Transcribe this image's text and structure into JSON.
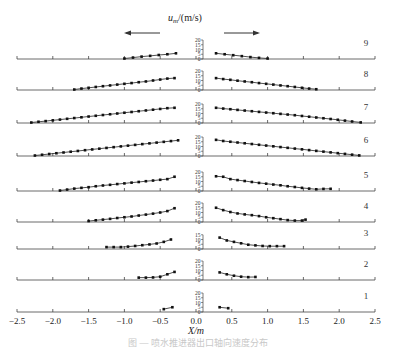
{
  "chart_data": {
    "type": "line",
    "title": "",
    "ylabel": "u_m/(m/s)",
    "ylabel_main": "u",
    "ylabel_sub": "m",
    "ylabel_unit": "/(m/s)",
    "xlabel": "X/m",
    "xlim": [
      -2.5,
      2.5
    ],
    "x_ticks": [
      -2.5,
      -2.0,
      -1.5,
      -1.0,
      -0.5,
      0.0,
      0.5,
      1.0,
      1.5,
      2.0,
      2.5
    ],
    "x_tick_labels": [
      "-2.5",
      "-2.0",
      "-1.5",
      "-1.0",
      "-0.5",
      "0.0",
      "0.5",
      "1.0",
      "1.5",
      "2.0",
      "2.5"
    ],
    "grid": false,
    "direction_arrows": [
      "left",
      "right"
    ],
    "panels": [
      {
        "label": "9",
        "y_ticks": [
          0,
          5,
          10,
          15,
          20
        ],
        "ylim": [
          0,
          20
        ],
        "left": {
          "x": [
            -1.0,
            -0.88,
            -0.76,
            -0.64,
            -0.52,
            -0.4,
            -0.28
          ],
          "y": [
            0.5,
            1.5,
            2.5,
            3.3,
            4.2,
            5.0,
            6.0
          ]
        },
        "right": {
          "x": [
            0.28,
            0.4,
            0.52,
            0.64,
            0.76,
            0.88,
            1.0
          ],
          "y": [
            6.0,
            5.0,
            4.0,
            3.0,
            2.0,
            1.2,
            0.5
          ]
        }
      },
      {
        "label": "8",
        "y_ticks": [
          0,
          5,
          10,
          15,
          20
        ],
        "ylim": [
          0,
          20
        ],
        "left": {
          "x": [
            -1.7,
            -1.6,
            -1.5,
            -1.4,
            -1.3,
            -1.2,
            -1.1,
            -1.0,
            -0.9,
            -0.8,
            -0.7,
            -0.6,
            -0.5,
            -0.4,
            -0.3
          ],
          "y": [
            0.5,
            1.5,
            2.3,
            3.2,
            4.0,
            4.8,
            5.7,
            6.5,
            7.3,
            8.2,
            9.0,
            10.0,
            11.0,
            12.0,
            12.5
          ]
        },
        "right": {
          "x": [
            0.28,
            0.38,
            0.48,
            0.58,
            0.68,
            0.78,
            0.88,
            0.98,
            1.08,
            1.18,
            1.28,
            1.38,
            1.48,
            1.58,
            1.68
          ],
          "y": [
            12.5,
            11.5,
            10.7,
            9.8,
            9.0,
            8.2,
            7.3,
            6.5,
            5.7,
            4.8,
            4.0,
            3.2,
            2.3,
            1.5,
            0.8
          ]
        }
      },
      {
        "label": "7",
        "y_ticks": [
          0,
          5,
          10,
          15,
          20
        ],
        "ylim": [
          0,
          20
        ],
        "left": {
          "x": [
            -2.3,
            -2.2,
            -2.1,
            -2.0,
            -1.9,
            -1.8,
            -1.7,
            -1.6,
            -1.5,
            -1.4,
            -1.3,
            -1.2,
            -1.1,
            -1.0,
            -0.9,
            -0.8,
            -0.7,
            -0.6,
            -0.5,
            -0.4,
            -0.3
          ],
          "y": [
            0.5,
            1.3,
            2.0,
            2.8,
            3.6,
            4.4,
            5.2,
            6.0,
            6.8,
            7.6,
            8.4,
            9.2,
            10.0,
            10.8,
            11.6,
            12.4,
            13.2,
            14.0,
            14.8,
            15.6,
            16.0
          ]
        },
        "right": {
          "x": [
            0.28,
            0.38,
            0.48,
            0.58,
            0.68,
            0.78,
            0.88,
            0.98,
            1.08,
            1.18,
            1.28,
            1.38,
            1.48,
            1.58,
            1.68,
            1.78,
            1.88,
            1.98,
            2.08,
            2.18,
            2.3
          ],
          "y": [
            16.0,
            15.2,
            14.5,
            13.8,
            13.1,
            12.4,
            11.7,
            11.0,
            10.3,
            9.6,
            8.9,
            8.2,
            7.4,
            6.6,
            5.8,
            5.0,
            4.2,
            3.4,
            2.5,
            1.6,
            0.6
          ]
        }
      },
      {
        "label": "6",
        "y_ticks": [
          0,
          5,
          10,
          15,
          20
        ],
        "ylim": [
          0,
          20
        ],
        "left": {
          "x": [
            -2.25,
            -2.15,
            -2.05,
            -1.95,
            -1.85,
            -1.75,
            -1.65,
            -1.55,
            -1.45,
            -1.35,
            -1.25,
            -1.15,
            -1.05,
            -0.95,
            -0.85,
            -0.75,
            -0.65,
            -0.55,
            -0.45,
            -0.35,
            -0.25
          ],
          "y": [
            0.5,
            1.3,
            2.1,
            2.9,
            3.7,
            4.5,
            5.3,
            6.1,
            6.9,
            7.7,
            8.5,
            9.3,
            10.1,
            10.9,
            11.7,
            12.5,
            13.3,
            14.1,
            14.9,
            15.7,
            16.5
          ]
        },
        "right": {
          "x": [
            0.28,
            0.38,
            0.48,
            0.58,
            0.68,
            0.78,
            0.88,
            0.98,
            1.08,
            1.18,
            1.28,
            1.38,
            1.48,
            1.58,
            1.68,
            1.78,
            1.88,
            1.98,
            2.08,
            2.18,
            2.28
          ],
          "y": [
            17.0,
            15.8,
            15.0,
            14.2,
            13.4,
            12.6,
            11.8,
            11.0,
            10.2,
            9.4,
            8.6,
            7.8,
            7.0,
            6.2,
            5.4,
            4.6,
            3.8,
            3.0,
            2.2,
            1.4,
            0.6
          ]
        }
      },
      {
        "label": "5",
        "y_ticks": [
          0,
          5,
          10,
          15,
          20
        ],
        "ylim": [
          0,
          20
        ],
        "left": {
          "x": [
            -1.9,
            -1.8,
            -1.7,
            -1.6,
            -1.5,
            -1.4,
            -1.3,
            -1.2,
            -1.1,
            -1.0,
            -0.9,
            -0.8,
            -0.7,
            -0.6,
            -0.5,
            -0.4,
            -0.3
          ],
          "y": [
            0.5,
            1.5,
            2.5,
            3.3,
            4.0,
            5.0,
            5.8,
            6.5,
            7.3,
            8.0,
            8.8,
            9.5,
            10.3,
            11.0,
            11.8,
            12.5,
            15.0
          ]
        },
        "right": {
          "x": [
            0.28,
            0.38,
            0.48,
            0.58,
            0.68,
            0.78,
            0.88,
            0.98,
            1.08,
            1.18,
            1.28,
            1.38,
            1.48,
            1.58,
            1.68,
            1.78,
            1.88
          ],
          "y": [
            15.5,
            15.0,
            12.5,
            11.5,
            10.5,
            9.5,
            8.5,
            7.7,
            6.8,
            6.0,
            5.0,
            4.2,
            3.3,
            2.5,
            1.8,
            2.2,
            2.3
          ]
        }
      },
      {
        "label": "4",
        "y_ticks": [
          0,
          5,
          10,
          15,
          20
        ],
        "ylim": [
          0,
          20
        ],
        "left": {
          "x": [
            -1.5,
            -1.4,
            -1.3,
            -1.2,
            -1.1,
            -1.0,
            -0.9,
            -0.8,
            -0.7,
            -0.6,
            -0.5,
            -0.4,
            -0.3
          ],
          "y": [
            1.0,
            1.8,
            2.5,
            3.3,
            4.2,
            5.0,
            5.8,
            6.8,
            7.8,
            8.8,
            10.0,
            11.5,
            14.5
          ]
        },
        "right": {
          "x": [
            0.28,
            0.38,
            0.48,
            0.58,
            0.68,
            0.78,
            0.88,
            0.98,
            1.08,
            1.18,
            1.28,
            1.38,
            1.48,
            1.53
          ],
          "y": [
            15.0,
            12.5,
            10.5,
            9.0,
            8.0,
            7.2,
            6.2,
            5.0,
            4.0,
            3.0,
            2.0,
            1.5,
            1.5,
            2.5
          ]
        }
      },
      {
        "label": "3",
        "y_ticks": [
          0,
          5,
          10,
          15
        ],
        "ylim": [
          0,
          15
        ],
        "left": {
          "x": [
            -1.25,
            -1.15,
            -1.05,
            -0.95,
            -0.85,
            -0.75,
            -0.65,
            -0.55,
            -0.45,
            -0.35
          ],
          "y": [
            2.0,
            2.0,
            2.0,
            2.5,
            3.2,
            4.0,
            4.8,
            5.8,
            7.5,
            10.0
          ]
        },
        "right": {
          "x": [
            0.33,
            0.43,
            0.53,
            0.63,
            0.73,
            0.83,
            0.93,
            1.03,
            1.13,
            1.23
          ],
          "y": [
            12.0,
            9.0,
            7.5,
            6.0,
            4.5,
            3.8,
            3.2,
            3.0,
            3.0,
            3.0
          ]
        }
      },
      {
        "label": "2",
        "y_ticks": [
          0,
          5,
          10,
          15,
          20
        ],
        "ylim": [
          0,
          20
        ],
        "left": {
          "x": [
            -0.8,
            -0.7,
            -0.6,
            -0.5,
            -0.4,
            -0.3
          ],
          "y": [
            2.5,
            2.5,
            2.7,
            3.5,
            6.0,
            8.5
          ]
        },
        "right": {
          "x": [
            0.33,
            0.43,
            0.53,
            0.63,
            0.73,
            0.83
          ],
          "y": [
            8.0,
            6.0,
            4.5,
            3.5,
            3.0,
            3.2
          ]
        }
      },
      {
        "label": "1",
        "y_ticks": [
          0,
          5,
          10,
          15,
          20
        ],
        "ylim": [
          0,
          20
        ],
        "left": {
          "x": [
            -0.45,
            -0.33
          ],
          "y": [
            3.0,
            5.0
          ]
        },
        "right": {
          "x": [
            0.33,
            0.45
          ],
          "y": [
            5.0,
            4.0
          ]
        }
      }
    ]
  },
  "caption": "图 — 喷水推进器出口轴向速度分布"
}
